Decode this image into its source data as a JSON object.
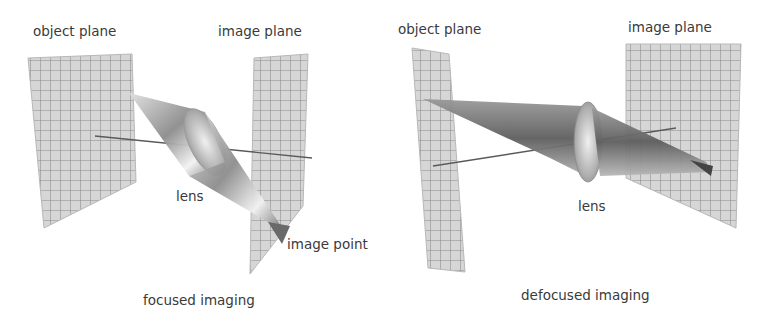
{
  "panels": [
    {
      "id": "focused",
      "caption": "focused imaging",
      "labels": {
        "object_plane": "object plane",
        "image_plane": "image plane",
        "lens": "lens",
        "image_point": "image point"
      }
    },
    {
      "id": "defocused",
      "caption": "defocused imaging",
      "labels": {
        "object_plane": "object plane",
        "image_plane": "image plane",
        "lens": "lens"
      }
    }
  ],
  "colors": {
    "plane_fill": "#d4d4d4",
    "grid_line": "#8a8a8a",
    "cone_dark": "#5a5a5a",
    "cone_light": "#e8e8e8",
    "text": "#3a3a3a"
  }
}
